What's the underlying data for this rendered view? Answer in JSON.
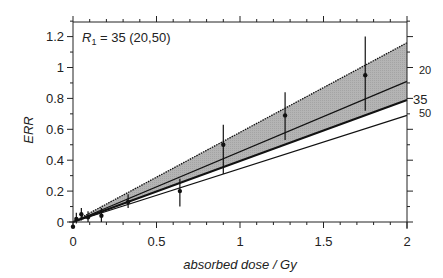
{
  "chart_data": {
    "type": "scatter",
    "title": "",
    "annotation": "R1 = 35 (20,50)",
    "annotation_parts": {
      "symbol": "R",
      "subscript": "1",
      "rest": " = 35 (20,50)"
    },
    "xlabel": "absorbed dose / Gy",
    "ylabel": "ERR",
    "xlim": [
      0,
      2
    ],
    "ylim": [
      -0.05,
      1.3
    ],
    "xticks": [
      0,
      0.5,
      1,
      1.5,
      2
    ],
    "xtick_labels": [
      "0",
      "0.5",
      "1",
      "1.5",
      "2"
    ],
    "yticks": [
      0,
      0.2,
      0.4,
      0.6,
      0.8,
      1,
      1.2
    ],
    "ytick_labels": [
      "0",
      "0.2",
      "0.4",
      "0.6",
      "0.8",
      "1",
      "1.2"
    ],
    "grid": false,
    "points": {
      "name": "observed ERR",
      "x": [
        0.0,
        0.02,
        0.05,
        0.09,
        0.17,
        0.33,
        0.64,
        0.9,
        1.27,
        1.75
      ],
      "y": [
        -0.03,
        0.02,
        0.05,
        0.03,
        0.04,
        0.13,
        0.2,
        0.5,
        0.69,
        0.95
      ],
      "ylow": [
        -0.04,
        -0.01,
        0.01,
        0.0,
        0.0,
        0.09,
        0.1,
        0.31,
        0.53,
        0.72
      ],
      "yhigh": [
        -0.02,
        0.06,
        0.09,
        0.07,
        0.09,
        0.18,
        0.28,
        0.63,
        0.84,
        1.2
      ]
    },
    "series": [
      {
        "name": "upper bound (dotted, shaded band)",
        "x": [
          0,
          2
        ],
        "y": [
          0,
          1.16
        ],
        "style": "dotted"
      },
      {
        "name": "20",
        "x": [
          0,
          2
        ],
        "y": [
          0,
          0.91
        ],
        "style": "solid"
      },
      {
        "name": "35",
        "x": [
          0,
          2
        ],
        "y": [
          0,
          0.79
        ],
        "style": "bold"
      },
      {
        "name": "50",
        "x": [
          0,
          2
        ],
        "y": [
          0,
          0.69
        ],
        "style": "solid"
      }
    ],
    "right_labels": [
      "20",
      "35",
      "50"
    ]
  }
}
